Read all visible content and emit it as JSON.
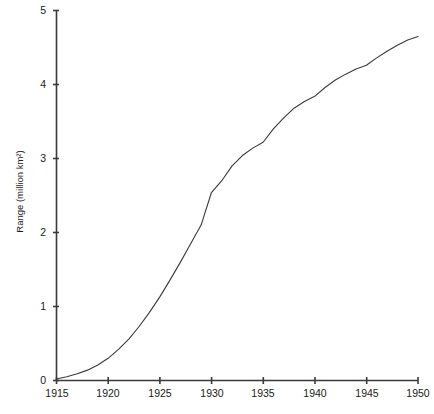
{
  "chart_data": {
    "type": "line",
    "title": "",
    "xlabel": "",
    "ylabel": "Range (million km²)",
    "xlim": [
      1915,
      1950
    ],
    "ylim": [
      0,
      5
    ],
    "xticks": [
      1915,
      1920,
      1925,
      1930,
      1935,
      1940,
      1945,
      1950
    ],
    "xtick_labels": [
      "1915",
      "1920",
      "1925",
      "1930",
      "1935",
      "1940",
      "1945",
      "1950"
    ],
    "yticks": [
      0,
      1,
      2,
      3,
      4,
      5
    ],
    "ytick_labels": [
      "0",
      "1",
      "2",
      "3",
      "4",
      "5"
    ],
    "grid": false,
    "legend": false,
    "legend_position": "none",
    "line_color": "#3a3a3a",
    "line_width": 1.1,
    "series": [
      {
        "name": "Range",
        "x": [
          1915,
          1916,
          1917,
          1918,
          1919,
          1920,
          1921,
          1922,
          1923,
          1924,
          1925,
          1926,
          1927,
          1928,
          1929,
          1930,
          1931,
          1932,
          1933,
          1934,
          1935,
          1936,
          1937,
          1938,
          1939,
          1940,
          1941,
          1942,
          1943,
          1944,
          1945,
          1946,
          1947,
          1948,
          1949,
          1950
        ],
        "values": [
          0.02,
          0.05,
          0.09,
          0.14,
          0.21,
          0.3,
          0.42,
          0.56,
          0.73,
          0.92,
          1.13,
          1.36,
          1.6,
          1.85,
          2.1,
          2.54,
          2.7,
          2.9,
          3.04,
          3.14,
          3.22,
          3.4,
          3.55,
          3.68,
          3.77,
          3.84,
          3.96,
          4.06,
          4.14,
          4.21,
          4.26,
          4.36,
          4.45,
          4.53,
          4.6,
          4.65
        ]
      }
    ],
    "annotations": []
  },
  "axis": {
    "y_title": "Range (million km²)"
  },
  "caption": {
    "text": ""
  }
}
